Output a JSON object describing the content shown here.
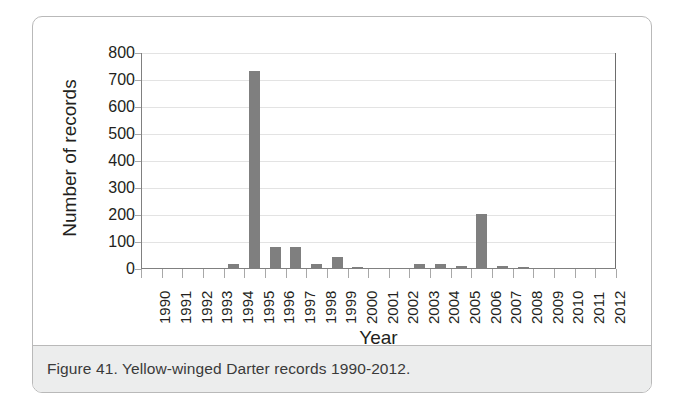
{
  "figure": {
    "caption": "Figure 41. Yellow-winged Darter records 1990-2012."
  },
  "chart_data": {
    "type": "bar",
    "title": "",
    "xlabel": "Year",
    "ylabel": "Number of records",
    "categories": [
      "1990",
      "1991",
      "1992",
      "1993",
      "1994",
      "1995",
      "1996",
      "1997",
      "1998",
      "1999",
      "2000",
      "2001",
      "2002",
      "2003",
      "2004",
      "2005",
      "2006",
      "2007",
      "2008",
      "2009",
      "2010",
      "2011",
      "2012"
    ],
    "values": [
      0,
      0,
      0,
      1,
      18,
      735,
      80,
      82,
      18,
      45,
      8,
      4,
      4,
      18,
      20,
      10,
      205,
      12,
      6,
      4,
      3,
      2,
      1
    ],
    "ylim": [
      0,
      800
    ],
    "yticks": [
      0,
      100,
      200,
      300,
      400,
      500,
      600,
      700,
      800
    ],
    "ytick_labels": [
      "0",
      "100",
      "200",
      "300",
      "400",
      "500",
      "600",
      "700",
      "800"
    ],
    "grid": true,
    "legend": "none",
    "bar_color": "#7f7f7f",
    "gridline_color": "#e3e3e3",
    "axis_color": "#808080",
    "text_color": "#231f20"
  }
}
